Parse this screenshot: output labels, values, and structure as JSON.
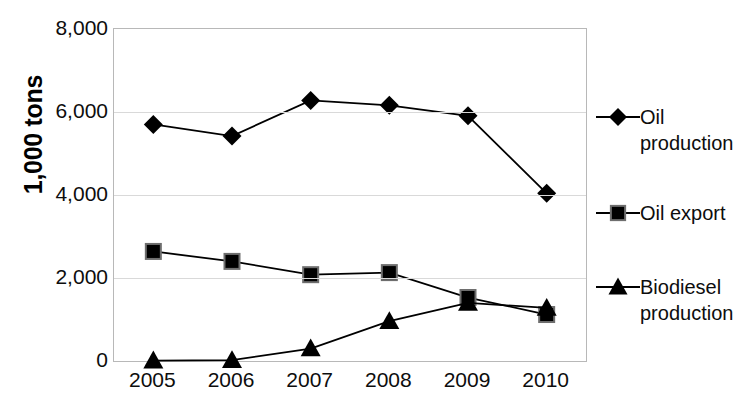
{
  "chart_data": {
    "type": "line",
    "title": "",
    "xlabel": "",
    "ylabel": "1,000 tons",
    "categories": [
      "2005",
      "2006",
      "2007",
      "2008",
      "2009",
      "2010"
    ],
    "ylim": [
      0,
      8000
    ],
    "ytick_labels": [
      "0",
      "2,000",
      "4,000",
      "6,000",
      "8,000"
    ],
    "ytick_values": [
      0,
      2000,
      4000,
      6000,
      8000
    ],
    "grid": true,
    "legend_position": "right",
    "series": [
      {
        "name": "Oil production",
        "marker": "diamond",
        "color": "#000000",
        "values": [
          5700,
          5420,
          6280,
          6160,
          5910,
          4040
        ]
      },
      {
        "name": "Oil export",
        "marker": "square",
        "color": "#000000",
        "values": [
          2640,
          2400,
          2080,
          2130,
          1530,
          1120
        ]
      },
      {
        "name": "Biodiesel production",
        "marker": "triangle",
        "color": "#000000",
        "values": [
          10,
          20,
          300,
          960,
          1400,
          1280
        ]
      }
    ]
  },
  "legend": {
    "entries": [
      {
        "label": "Oil production",
        "marker": "diamond-marker-icon"
      },
      {
        "label": "Oil export",
        "marker": "square-marker-icon"
      },
      {
        "label": "Biodiesel production",
        "marker": "triangle-marker-icon"
      }
    ]
  },
  "axis": {
    "y_title": "1,000 tons"
  }
}
